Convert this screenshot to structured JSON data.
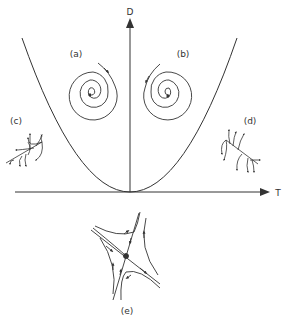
{
  "axes": {
    "y_label": "D",
    "x_label": "T"
  },
  "regions": [
    {
      "label": "(a)",
      "type": "spiral",
      "direction": "clockwise-inward"
    },
    {
      "label": "(b)",
      "type": "spiral",
      "direction": "counterclockwise-outward"
    },
    {
      "label": "(c)",
      "type": "node",
      "stability": "stable"
    },
    {
      "label": "(d)",
      "type": "node",
      "stability": "unstable"
    },
    {
      "label": "(e)",
      "type": "saddle"
    }
  ],
  "colors": {
    "line": "#333333",
    "background": "#ffffff"
  }
}
